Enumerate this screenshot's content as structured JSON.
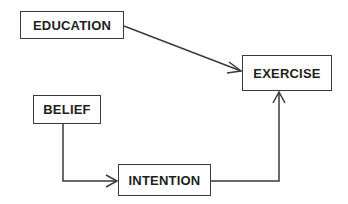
{
  "diagram": {
    "nodes": [
      {
        "id": "education",
        "label": "EDUCATION",
        "x": 20,
        "y": 11,
        "w": 104,
        "h": 28
      },
      {
        "id": "exercise",
        "label": "EXERCISE",
        "x": 242,
        "y": 55,
        "w": 90,
        "h": 36
      },
      {
        "id": "belief",
        "label": "BELIEF",
        "x": 33,
        "y": 95,
        "w": 68,
        "h": 29
      },
      {
        "id": "intention",
        "label": "INTENTION",
        "x": 118,
        "y": 164,
        "w": 93,
        "h": 32
      }
    ],
    "edges": [
      {
        "from": "education",
        "to": "exercise"
      },
      {
        "from": "belief",
        "to": "intention"
      },
      {
        "from": "intention",
        "to": "exercise"
      }
    ],
    "colors": {
      "stroke": "#3a3a3a",
      "text": "#1e1e1e",
      "background": "#ffffff"
    }
  }
}
